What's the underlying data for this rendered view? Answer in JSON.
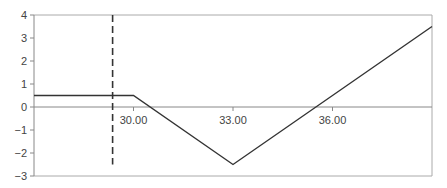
{
  "chart_data": {
    "type": "line",
    "title": "",
    "xlabel": "",
    "ylabel": "",
    "xlim": [
      27,
      39
    ],
    "ylim": [
      -3,
      4
    ],
    "grid": false,
    "legend": null,
    "x_tick_labels": [
      "30.00",
      "33.00",
      "36.00"
    ],
    "x_ticks": [
      30,
      33,
      36
    ],
    "y_tick_labels": [
      "4",
      "3",
      "2",
      "1",
      "0",
      "−1",
      "−2",
      "−3"
    ],
    "y_ticks": [
      4,
      3,
      2,
      1,
      0,
      -1,
      -2,
      -3
    ],
    "series": [
      {
        "name": "payoff",
        "style": "solid",
        "color": "#333333",
        "x": [
          27,
          30,
          33,
          39
        ],
        "y": [
          0.5,
          0.5,
          -2.5,
          3.5
        ]
      }
    ],
    "annotations": [
      {
        "type": "vertical-dashed-line",
        "x": 29.37,
        "y_from": 4,
        "y_to": -2.5,
        "color": "#333333"
      }
    ],
    "colors": {
      "axis": "#888888",
      "line": "#333333",
      "dashed": "#333333"
    }
  }
}
